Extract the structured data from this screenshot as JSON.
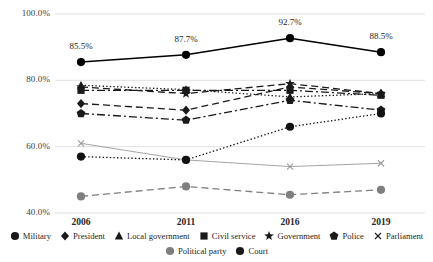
{
  "chart_data": {
    "type": "line",
    "title": "",
    "subtitle": "",
    "xlabel": "",
    "ylabel": "",
    "categories": [
      "2006",
      "2011",
      "2016",
      "2019"
    ],
    "ylim": [
      40.0,
      100.0
    ],
    "ytick_labels": [
      "100.0%",
      "80.0%",
      "60.0%",
      "40.0%"
    ],
    "ytick_values": [
      100.0,
      80.0,
      60.0,
      40.0
    ],
    "grid": true,
    "grid_axis": "y",
    "legend_position": "bottom",
    "series": [
      {
        "name": "Military",
        "values": [
          85.5,
          87.7,
          92.7,
          88.5
        ],
        "marker": "circle",
        "dash": "solid",
        "color": "#000000",
        "labels": [
          "85.5%",
          "87.7%",
          "92.7%",
          "88.5%"
        ]
      },
      {
        "name": "President",
        "values": [
          73.0,
          71.0,
          78.0,
          76.0
        ],
        "marker": "diamond",
        "dash": "dashed",
        "color": "#1a1a1a",
        "labels": []
      },
      {
        "name": "Local government",
        "values": [
          78.5,
          77.2,
          75.0,
          76.0
        ],
        "marker": "triangle",
        "dash": "dotted",
        "color": "#1a1a1a",
        "labels": []
      },
      {
        "name": "Civil service",
        "values": [
          77.0,
          77.0,
          77.0,
          75.5
        ],
        "marker": "square",
        "dash": "dashdot",
        "color": "#1a1a1a",
        "labels": []
      },
      {
        "name": "Government",
        "values": [
          78.0,
          76.0,
          79.0,
          76.0
        ],
        "marker": "star",
        "dash": "dashed",
        "color": "#1a1a1a",
        "labels": []
      },
      {
        "name": "Police",
        "values": [
          70.0,
          68.0,
          74.0,
          71.0
        ],
        "marker": "pentagon",
        "dash": "dashdot",
        "color": "#1a1a1a",
        "labels": []
      },
      {
        "name": "Parliament",
        "values": [
          61.0,
          56.0,
          54.0,
          55.0
        ],
        "marker": "cross",
        "dash": "solid",
        "color": "#9a9a9a",
        "labels": []
      },
      {
        "name": "Political party",
        "values": [
          45.0,
          48.0,
          45.5,
          47.0
        ],
        "marker": "circle",
        "dash": "dashed",
        "color": "#7f7f7f",
        "labels": []
      },
      {
        "name": "Court",
        "values": [
          57.0,
          56.0,
          66.0,
          70.0
        ],
        "marker": "circle",
        "dash": "dotted",
        "color": "#111111",
        "labels": []
      }
    ]
  },
  "axis": {
    "y_labels": [
      "100.0%",
      "80.0%",
      "60.0%",
      "40.0%"
    ],
    "x_labels": [
      "2006",
      "2011",
      "2016",
      "2019"
    ]
  },
  "data_labels": {
    "military": [
      "85.5%",
      "87.7%",
      "92.7%",
      "88.5%"
    ]
  },
  "legend": {
    "row1": [
      {
        "label": "Military",
        "marker": "circle"
      },
      {
        "label": "President",
        "marker": "diamond"
      },
      {
        "label": "Local government",
        "marker": "triangle"
      },
      {
        "label": "Civil service",
        "marker": "square"
      },
      {
        "label": "Government",
        "marker": "star"
      },
      {
        "label": "Police",
        "marker": "pentagon"
      },
      {
        "label": "Parliament",
        "marker": "cross"
      }
    ],
    "row2": [
      {
        "label": "Political party",
        "marker": "circle-gray"
      },
      {
        "label": "Court",
        "marker": "circle"
      }
    ]
  }
}
